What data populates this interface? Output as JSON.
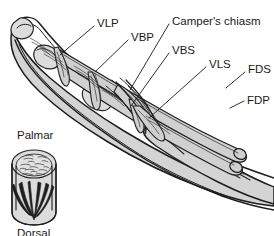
{
  "figure": {
    "background_color": "#ffffff",
    "ink_color": "#1a1a1a",
    "tissue_fill": "#d4d4d4"
  },
  "labels": {
    "vlp": "VLP",
    "vbp": "VBP",
    "vbs": "VBS",
    "vls": "VLS",
    "campers_chiasm": "Camper's chiasm",
    "fds": "FDS",
    "fdp": "FDP"
  },
  "inset": {
    "top_label": "Palmar",
    "bottom_label": "Dorsal"
  },
  "label_positions": [
    {
      "key": "vlp",
      "text": "VLP",
      "x": 97,
      "y": 24
    },
    {
      "key": "vbp",
      "text": "VBP",
      "x": 131,
      "y": 38
    },
    {
      "key": "vbs",
      "text": "VBS",
      "x": 172,
      "y": 51
    },
    {
      "key": "vls",
      "text": "VLS",
      "x": 209,
      "y": 65
    },
    {
      "key": "campers_chiasm",
      "text": "Camper's chiasm",
      "x": 172,
      "y": 22
    },
    {
      "key": "fds",
      "text": "FDS",
      "x": 248,
      "y": 70
    },
    {
      "key": "fdp",
      "text": "FDP",
      "x": 247,
      "y": 101
    }
  ],
  "structures": [
    {
      "name": "finger-skin-envelope",
      "kind": "outline"
    },
    {
      "name": "phalanx-proximal",
      "kind": "bone"
    },
    {
      "name": "phalanx-middle",
      "kind": "bone"
    },
    {
      "name": "fds-tendon",
      "kind": "tendon"
    },
    {
      "name": "fdp-tendon",
      "kind": "tendon"
    },
    {
      "name": "vinculum-longum-profundus",
      "kind": "vinculum"
    },
    {
      "name": "vinculum-breve-profundus",
      "kind": "vinculum"
    },
    {
      "name": "vinculum-breve-superficialis",
      "kind": "vinculum"
    },
    {
      "name": "vinculum-longum-superficialis",
      "kind": "vinculum"
    },
    {
      "name": "campers-chiasm-decussation",
      "kind": "crossing-fibers"
    },
    {
      "name": "cross-section-inset",
      "kind": "inset"
    }
  ]
}
